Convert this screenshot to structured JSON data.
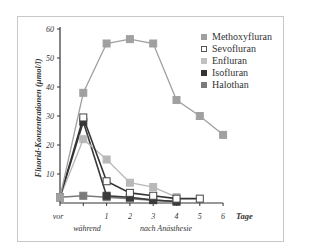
{
  "chart_data": {
    "type": "line",
    "title": "",
    "xlabel": "Tage",
    "ylabel": "Fluorid-Konzentrationen (µmol/l)",
    "x": [
      "vor",
      "während",
      "1",
      "2",
      "3",
      "4",
      "5",
      "6"
    ],
    "x_group_labels": [
      "während",
      "nach Anästhesie"
    ],
    "ylim": [
      0,
      60
    ],
    "yticks": [
      10,
      20,
      30,
      40,
      50,
      60
    ],
    "grid": false,
    "legend_position": "upper right",
    "series": [
      {
        "name": "Methoxyfluran",
        "color": "#a0a0a0",
        "marker": "square-filled",
        "values": [
          2,
          38,
          55,
          56.5,
          55,
          35.5,
          30,
          23.5
        ]
      },
      {
        "name": "Sevofluran",
        "color": "#333333",
        "marker": "square-open",
        "values": [
          2,
          29.5,
          7.5,
          3.5,
          2.5,
          1.5,
          1.5,
          null
        ]
      },
      {
        "name": "Enfluran",
        "color": "#b8b8b8",
        "marker": "square-filled",
        "values": [
          2,
          22,
          15,
          7,
          5.5,
          2,
          null,
          null
        ]
      },
      {
        "name": "Isofluran",
        "color": "#3a3a3a",
        "marker": "square-filled",
        "values": [
          2,
          28,
          2.5,
          2,
          1,
          0.5,
          null,
          null
        ]
      },
      {
        "name": "Halothan",
        "color": "#7a7a7a",
        "marker": "square-filled",
        "values": [
          2,
          2.5,
          2,
          1.5,
          1,
          0.5,
          null,
          null
        ]
      }
    ]
  },
  "labels": {
    "ylabel": "Fluorid-Konzentrationen (µmol/l)",
    "xlabel_unit": "Tage",
    "vor": "vor",
    "waehrend": "während",
    "nach": "nach Anästhesie",
    "xticks": [
      "1",
      "2",
      "3",
      "4",
      "5",
      "6"
    ],
    "yticks": [
      "10",
      "20",
      "30",
      "40",
      "50",
      "60"
    ]
  },
  "legend": [
    {
      "name": "Methoxyfluran",
      "fill": "#a0a0a0",
      "border": "#a0a0a0"
    },
    {
      "name": "Sevofluran",
      "fill": "#ffffff",
      "border": "#555555"
    },
    {
      "name": "Enfluran",
      "fill": "#c0c0c0",
      "border": "#c0c0c0"
    },
    {
      "name": "Isofluran",
      "fill": "#333333",
      "border": "#333333"
    },
    {
      "name": "Halothan",
      "fill": "#7a7a7a",
      "border": "#7a7a7a"
    }
  ]
}
